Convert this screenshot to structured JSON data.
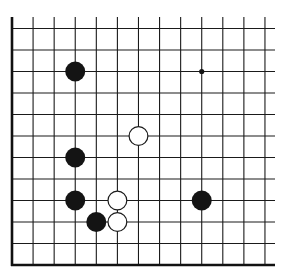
{
  "diagram": {
    "type": "go-board-fragment",
    "colors": {
      "background": "#ffffff",
      "line": "#1a1a1a",
      "black_stone": "#141414",
      "white_stone": "#ffffff"
    },
    "grid": {
      "columns": 13,
      "rows": 12,
      "x0": 12,
      "y0": 28.5,
      "dx": 21.08,
      "dy": 21.5,
      "open_top_extend_to": 17,
      "open_right_extend_to": 275,
      "thick_edges": [
        "left",
        "bottom"
      ]
    },
    "stones": [
      {
        "color": "black",
        "col": 3,
        "row": 2
      },
      {
        "color": "white",
        "col": 6,
        "row": 5
      },
      {
        "color": "black",
        "col": 3,
        "row": 6
      },
      {
        "color": "black",
        "col": 3,
        "row": 8
      },
      {
        "color": "white",
        "col": 5,
        "row": 8
      },
      {
        "color": "black",
        "col": 9,
        "row": 8
      },
      {
        "color": "black",
        "col": 4,
        "row": 9
      },
      {
        "color": "white",
        "col": 5,
        "row": 9
      }
    ],
    "markers": [
      {
        "type": "star-point",
        "col": 9,
        "row": 2
      }
    ],
    "stone_radius": 10
  }
}
